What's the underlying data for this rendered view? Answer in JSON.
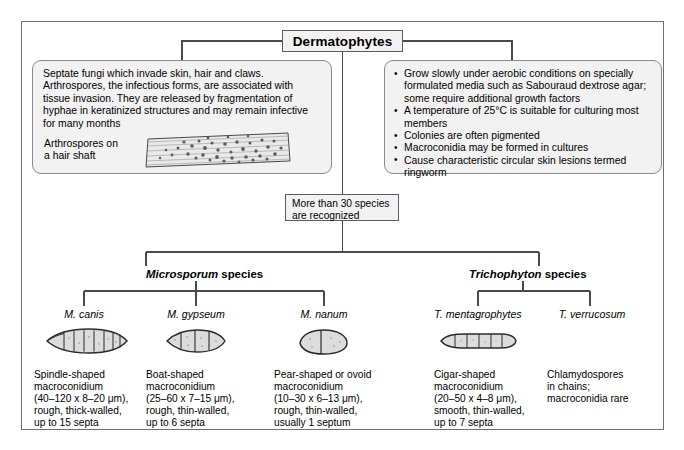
{
  "diagram": {
    "title": "Dermatophytes",
    "left_panel": {
      "text": "Septate fungi which invade skin, hair and claws. Arthrospores, the infectious forms, are associated with tissue invasion. They are released by fragmentation of hyphae in keratinized structures and may remain infective for many months",
      "image_caption": "Arthrospores on\na hair shaft",
      "image_name": "hair-shaft-micrograph"
    },
    "right_panel": {
      "bullets": [
        "Grow slowly under aerobic conditions on specially formulated media such as Sabouraud dextrose agar; some require additional growth factors",
        "A temperature of 25°C is suitable for culturing most members",
        "Colonies are often pigmented",
        "Macroconidia may be formed in cultures",
        "Cause characteristic circular skin lesions termed ringworm"
      ]
    },
    "middle_note": "More than 30 species\nare recognized",
    "genera": [
      {
        "name": "Microsporum",
        "suffix": " species"
      },
      {
        "name": "Trichophyton",
        "suffix": " species"
      }
    ],
    "species": [
      {
        "name": "M. canis",
        "shape_icon": "spindle-macroconidium-icon",
        "description": "Spindle-shaped\nmacroconidium\n(40–120 x 8–20 μm),\nrough, thick-walled,\nup to 15 septa"
      },
      {
        "name": "M. gypseum",
        "shape_icon": "boat-macroconidium-icon",
        "description": "Boat-shaped\nmacroconidium\n(25–60 x 7–15 μm),\nrough, thin-walled,\nup to 6 septa"
      },
      {
        "name": "M. nanum",
        "shape_icon": "pear-macroconidium-icon",
        "description": "Pear-shaped or ovoid\nmacroconidium\n(10–30 x 6–13 μm),\nrough, thin-walled,\nusually 1 septum"
      },
      {
        "name": "T. mentagrophytes",
        "shape_icon": "cigar-macroconidium-icon",
        "description": "Cigar-shaped\nmacroconidium\n(20–50 x 4–8 μm),\nsmooth, thin-walled,\nup to 7 septa"
      },
      {
        "name": "T. verrucosum",
        "shape_icon": "none",
        "description": "Chlamydospores\nin chains;\nmacroconidia rare"
      }
    ],
    "colors": {
      "box_fill": "#f2f2f2",
      "box_border": "#5d5d5d",
      "panel_border": "#8a8a8a",
      "frame_border": "#6f6f6f",
      "line": "#4a4a4a"
    }
  }
}
